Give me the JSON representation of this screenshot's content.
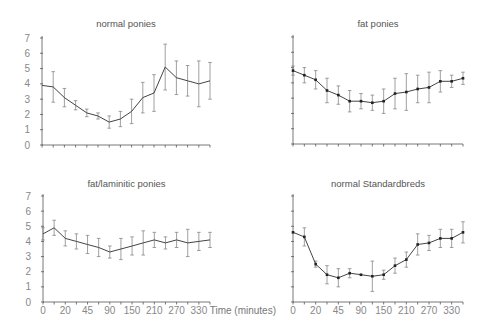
{
  "chart_data": {
    "type": "line",
    "xlabel": "Time (minutes)",
    "ylabel": "",
    "ylim": [
      0,
      7
    ],
    "y_ticks": [
      0,
      1,
      2,
      3,
      4,
      5,
      6,
      7
    ],
    "x_tick_labels": [
      "0",
      "20",
      "45",
      "90",
      "150",
      "210",
      "270",
      "330"
    ],
    "x_points": 16,
    "grid": false,
    "panels": [
      {
        "title": "normal ponies",
        "position": "top-left",
        "show_y_labels": true,
        "show_x_labels": false,
        "marker": "none",
        "values": [
          3.9,
          3.8,
          3.1,
          2.6,
          2.1,
          1.9,
          1.5,
          1.7,
          2.2,
          3.1,
          3.4,
          5.1,
          4.4,
          4.2,
          4.0,
          4.2
        ],
        "errors": [
          0.0,
          1.0,
          0.6,
          0.3,
          0.25,
          0.2,
          0.4,
          0.5,
          0.8,
          1.0,
          1.2,
          1.5,
          1.1,
          1.0,
          1.5,
          1.2
        ]
      },
      {
        "title": "fat ponies",
        "position": "top-right",
        "show_y_labels": false,
        "show_x_labels": false,
        "marker": "square",
        "values": [
          4.8,
          4.5,
          4.2,
          3.5,
          3.2,
          2.8,
          2.8,
          2.7,
          2.8,
          3.3,
          3.4,
          3.6,
          3.7,
          4.1,
          4.1,
          4.3
        ],
        "errors": [
          0.3,
          0.5,
          0.6,
          0.8,
          0.6,
          0.7,
          0.5,
          0.5,
          0.8,
          1.0,
          1.2,
          0.9,
          1.0,
          0.7,
          0.4,
          0.4
        ]
      },
      {
        "title": "fat/laminitic ponies",
        "position": "bottom-left",
        "show_y_labels": true,
        "show_x_labels": true,
        "marker": "none",
        "values": [
          4.5,
          4.9,
          4.2,
          4.0,
          3.8,
          3.6,
          3.3,
          3.5,
          3.7,
          3.9,
          4.1,
          3.9,
          4.1,
          3.9,
          4.0,
          4.1
        ],
        "errors": [
          0.4,
          0.5,
          0.5,
          0.5,
          0.6,
          0.6,
          0.4,
          0.7,
          0.6,
          0.8,
          0.5,
          0.4,
          0.5,
          0.9,
          0.6,
          0.5
        ]
      },
      {
        "title": "normal Standardbreds",
        "position": "bottom-right",
        "show_y_labels": false,
        "show_x_labels": true,
        "marker": "square",
        "values": [
          4.6,
          4.3,
          2.5,
          1.8,
          1.6,
          1.9,
          1.8,
          1.7,
          1.8,
          2.4,
          2.8,
          3.8,
          3.9,
          4.2,
          4.2,
          4.6
        ],
        "errors": [
          0.0,
          0.6,
          0.2,
          0.6,
          0.6,
          0.3,
          0.0,
          1.0,
          0.3,
          0.5,
          0.5,
          0.7,
          0.5,
          0.6,
          0.6,
          0.7
        ]
      }
    ]
  }
}
